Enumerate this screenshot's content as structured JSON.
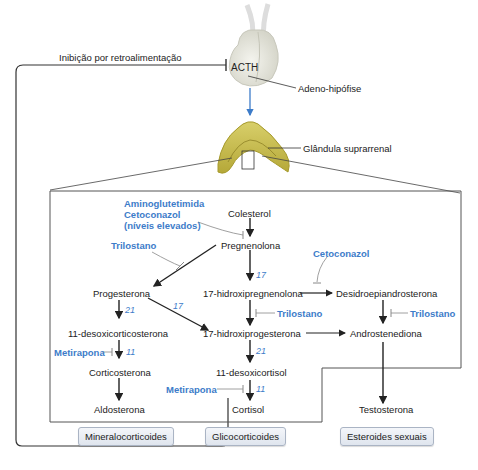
{
  "feedback": {
    "label": "Inibição por retroalimentação"
  },
  "pituitary": {
    "hormone": "ACTH",
    "label": "Adeno-hipófise"
  },
  "adrenal": {
    "label": "Glândula suprarrenal"
  },
  "steroids": {
    "colesterol": "Colesterol",
    "pregnenolona": "Pregnenolona",
    "progesterona": "Progesterona",
    "hidroxipregnenolona": "17-hidroxipregnenolona",
    "desidroepiandrosterona": "Desidroepiandrosterona",
    "desoxicorticosterona": "11-desoxicorticosterona",
    "hidroxiprogesterona": "17-hidroxiprogesterona",
    "androstenediona": "Androstenediona",
    "corticosterona": "Corticosterona",
    "desoxicortisol": "11-desoxicortisol",
    "aldosterona": "Aldosterona",
    "cortisol": "Cortisol",
    "testosterona": "Testosterona"
  },
  "inhibitors": {
    "aminoglutetimida": [
      "Aminoglutetimida",
      "Cetoconazol",
      "(níveis elevados)"
    ],
    "trilostano_top": "Trilostano",
    "cetoconazol": "Cetoconazol",
    "trilostano_mid": "Trilostano",
    "trilostano_right": "Trilostano",
    "metirapona_left": "Metirapona",
    "metirapona_mid": "Metirapona"
  },
  "enzymes": {
    "e17_top": "17",
    "e21_left": "21",
    "e17_diag": "17",
    "e11_left": "11",
    "e21_mid": "21",
    "e11_mid": "11"
  },
  "categories": [
    "Mineralocorticoides",
    "Glicocorticoides",
    "Esteroides sexuais"
  ],
  "colors": {
    "drug": "#3d7cc9",
    "acth_arrow": "#3d7cc9",
    "line": "#333333"
  }
}
